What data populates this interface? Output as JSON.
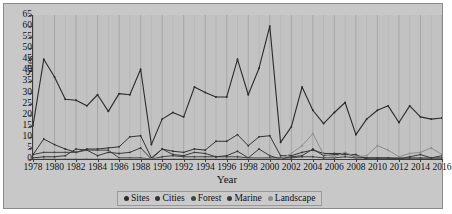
{
  "chart_data": {
    "type": "line",
    "title": "",
    "xlabel": "Year",
    "ylabel": "Sites",
    "xlim": [
      1978,
      2016
    ],
    "ylim": [
      0,
      65
    ],
    "ytick_step": 5,
    "xtick_step": 2,
    "grid": "vertical",
    "legend_position": "bottom",
    "x": [
      1978,
      1979,
      1980,
      1981,
      1982,
      1983,
      1984,
      1985,
      1986,
      1987,
      1988,
      1989,
      1990,
      1991,
      1992,
      1993,
      1994,
      1995,
      1996,
      1997,
      1998,
      1999,
      2000,
      2001,
      2002,
      2003,
      2004,
      2005,
      2006,
      2007,
      2008,
      2009,
      2010,
      2011,
      2012,
      2013,
      2014,
      2015,
      2016
    ],
    "yticks": [
      0,
      5,
      10,
      15,
      20,
      25,
      30,
      35,
      40,
      45,
      50,
      55,
      60,
      65
    ],
    "xticks": [
      1978,
      1980,
      1982,
      1984,
      1986,
      1988,
      1990,
      1992,
      1994,
      1996,
      1998,
      2000,
      2002,
      2004,
      2006,
      2008,
      2010,
      2012,
      2014,
      2016
    ],
    "series": [
      {
        "name": "Sites",
        "color": "#2b2b2b",
        "values": [
          15,
          45,
          37,
          27,
          26.5,
          24,
          29,
          21.5,
          29.5,
          29,
          40.5,
          6.5,
          18,
          21,
          19,
          32.5,
          30,
          28,
          28,
          45,
          29,
          41,
          60,
          7.5,
          14.5,
          32.5,
          22,
          16,
          21,
          25.5,
          11,
          18,
          22,
          24,
          16.5,
          24,
          19,
          18,
          18.5
        ]
      },
      {
        "name": "Cities",
        "color": "#333333",
        "values": [
          2,
          9,
          6.5,
          4.5,
          3,
          4.5,
          4.5,
          5,
          5.5,
          10,
          10.5,
          0.5,
          4.5,
          3.5,
          3,
          4.5,
          4,
          8,
          8,
          11,
          6,
          10,
          10.5,
          1.5,
          1.5,
          3,
          4,
          2.5,
          2.5,
          2.5,
          1,
          0.5,
          0.5,
          0.5,
          0,
          0,
          0,
          0,
          0
        ]
      },
      {
        "name": "Forest",
        "color": "#444444",
        "values": [
          2,
          3,
          3,
          3,
          3,
          4,
          4,
          4,
          0.5,
          0.5,
          0.5,
          0,
          1,
          1.5,
          1,
          1,
          1,
          1,
          1,
          1,
          0.5,
          0.5,
          0.5,
          0.5,
          0.5,
          1,
          1,
          0.5,
          0.5,
          1,
          0.5,
          0.5,
          0.5,
          0.5,
          0.5,
          0.5,
          0.5,
          0.5,
          0.5
        ]
      },
      {
        "name": "Marine",
        "color": "#3a3a3a",
        "values": [
          0.5,
          1,
          1,
          1.5,
          4.5,
          4,
          1.5,
          3,
          2.5,
          3,
          5,
          0,
          4.5,
          2,
          1.5,
          3,
          2.5,
          1,
          1.5,
          3.5,
          0.5,
          4.5,
          1.5,
          0,
          1,
          1.5,
          4.5,
          1.5,
          2,
          2,
          2,
          0,
          0,
          0,
          0,
          1,
          2,
          0.5,
          1.5
        ]
      },
      {
        "name": "Landscape",
        "color": "#8d8d8d",
        "values": [
          0,
          0,
          0,
          0,
          0,
          0,
          0,
          0,
          0,
          0,
          0,
          0,
          0,
          0,
          0,
          0,
          0,
          0,
          0,
          0,
          0,
          0.5,
          0,
          0,
          2.5,
          6,
          11.5,
          2,
          1,
          3,
          1,
          1.5,
          6,
          4,
          1,
          2.5,
          3,
          5,
          2
        ]
      }
    ]
  }
}
